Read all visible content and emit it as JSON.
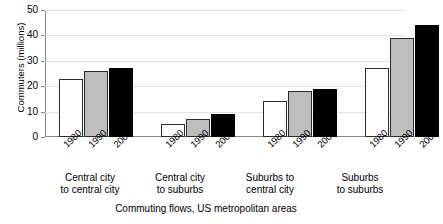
{
  "chart_data": {
    "type": "bar",
    "title": "",
    "xlabel": "Commuting flows, US metropolitan areas",
    "ylabel": "Commuters (millions)",
    "ylim": [
      0,
      50
    ],
    "yticks": [
      0,
      10,
      20,
      30,
      40,
      50
    ],
    "grid": true,
    "legend": "none",
    "categories": [
      "Central city to central city",
      "Central city to suburbs",
      "Suburbs to central city",
      "Suburbs to suburbs"
    ],
    "category_lines": [
      {
        "line1": "Central city",
        "line2": "to central city"
      },
      {
        "line1": "Central city",
        "line2": "to suburbs"
      },
      {
        "line1": "Suburbs to",
        "line2": "central city"
      },
      {
        "line1": "Suburbs",
        "line2": "to suburbs"
      }
    ],
    "subcategories": [
      "1980",
      "1990",
      "2000"
    ],
    "series": [
      {
        "name": "1980",
        "color": "#ffffff",
        "values": [
          23,
          5,
          14,
          27
        ]
      },
      {
        "name": "1990",
        "color": "#bdbdbd",
        "values": [
          26,
          7,
          18,
          39
        ]
      },
      {
        "name": "2000",
        "color": "#000000",
        "values": [
          27,
          9,
          19,
          44
        ]
      }
    ],
    "units": "millions of commuters"
  }
}
